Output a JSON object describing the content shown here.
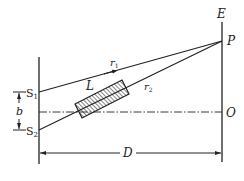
{
  "diagram": {
    "type": "double-slit interference with inserted slab",
    "labels": {
      "screen": "E",
      "point_p": "P",
      "point_o": "O",
      "slit1": "S",
      "slit1_sub": "1",
      "slit2": "S",
      "slit2_sub": "2",
      "slit_separation": "b",
      "slab": "L",
      "path1": "r",
      "path1_sub": "1",
      "path2": "r",
      "path2_sub": "2",
      "distance": "D"
    },
    "colors": {
      "stroke": "#222222",
      "background": "#ffffff"
    }
  }
}
